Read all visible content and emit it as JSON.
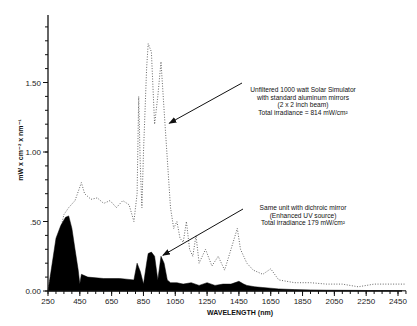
{
  "chart_data": {
    "type": "area",
    "title": "",
    "xlabel": "WAVELENGTH (nm)",
    "ylabel": "mW x cm⁻² x nm⁻¹",
    "xlim": [
      250,
      2500
    ],
    "ylim": [
      0,
      1.9
    ],
    "xticks": [
      250,
      450,
      650,
      850,
      1050,
      1250,
      1450,
      1650,
      1850,
      2050,
      2250,
      2450
    ],
    "yticks": [
      0.0,
      0.5,
      1.0,
      1.5
    ],
    "ytick_labels": [
      "0.00",
      ".50",
      "1.00",
      "1.50"
    ],
    "grid": false,
    "series": [
      {
        "name": "Unfiltered 1000 watt Solar Simulator",
        "style": "dotted line",
        "x": [
          250,
          300,
          350,
          380,
          420,
          460,
          480,
          520,
          560,
          600,
          640,
          680,
          720,
          760,
          790,
          810,
          820,
          830,
          840,
          850,
          870,
          880,
          900,
          920,
          940,
          960,
          980,
          1000,
          1020,
          1040,
          1060,
          1080,
          1100,
          1120,
          1140,
          1160,
          1180,
          1200,
          1240,
          1280,
          1320,
          1360,
          1400,
          1440,
          1460,
          1480,
          1500,
          1540,
          1600,
          1650,
          1700,
          1800,
          1900,
          2000,
          2100,
          2200,
          2300,
          2400,
          2500
        ],
        "values": [
          0.0,
          0.3,
          0.55,
          0.6,
          0.65,
          0.78,
          0.7,
          0.66,
          0.67,
          0.63,
          0.65,
          0.6,
          0.65,
          0.62,
          0.5,
          0.7,
          1.4,
          0.9,
          0.6,
          1.0,
          1.6,
          1.78,
          1.72,
          1.2,
          1.4,
          1.65,
          1.3,
          0.95,
          0.6,
          0.45,
          0.5,
          0.38,
          0.35,
          0.5,
          0.3,
          0.25,
          0.4,
          0.2,
          0.3,
          0.18,
          0.25,
          0.15,
          0.3,
          0.45,
          0.3,
          0.25,
          0.2,
          0.15,
          0.12,
          0.16,
          0.08,
          0.06,
          0.06,
          0.05,
          0.05,
          0.03,
          0.05,
          0.05,
          0.05
        ]
      },
      {
        "name": "Same unit with dichroic mirror (Enhanced UV source)",
        "style": "filled black area",
        "x": [
          250,
          270,
          300,
          330,
          360,
          380,
          400,
          420,
          440,
          450,
          460,
          500,
          600,
          700,
          790,
          810,
          830,
          850,
          870,
          880,
          900,
          920,
          940,
          960,
          980,
          1000,
          1020,
          1060,
          1100,
          1150,
          1200,
          1250,
          1300,
          1350,
          1400,
          1450,
          1480,
          1500,
          1550,
          1600,
          1650,
          1700,
          1800,
          1900,
          2000,
          2100,
          2200,
          2300,
          2400,
          2500
        ],
        "values": [
          0.0,
          0.15,
          0.38,
          0.47,
          0.53,
          0.54,
          0.45,
          0.3,
          0.15,
          0.05,
          0.12,
          0.1,
          0.09,
          0.09,
          0.08,
          0.2,
          0.14,
          0.05,
          0.2,
          0.27,
          0.28,
          0.25,
          0.08,
          0.25,
          0.2,
          0.08,
          0.06,
          0.06,
          0.05,
          0.06,
          0.04,
          0.06,
          0.04,
          0.05,
          0.05,
          0.07,
          0.05,
          0.04,
          0.03,
          0.025,
          0.02,
          0.015,
          0.01,
          0.008,
          0.006,
          0.005,
          0.004,
          0.003,
          0.003,
          0.002
        ]
      }
    ],
    "annotations": [
      {
        "lines": [
          "Unfiltered 1000 watt Solar Simulator",
          "with standard aluminum mirrors",
          "(2 x 2 inch beam)",
          "Total irradiance = 814 mW/cm²"
        ],
        "arrow_to": [
          1000,
          1.2
        ]
      },
      {
        "lines": [
          "Same unit with dichroic mirror",
          "(Enhanced UV source)",
          "Total irradiance 179 mW/cm²"
        ],
        "arrow_to": [
          960,
          0.25
        ]
      }
    ],
    "legend": "none (inline annotations with arrows)"
  },
  "colors": {
    "background": "#ffffff",
    "axis": "#111111",
    "filled_series": "#000000",
    "dotted_series": "#555555"
  }
}
